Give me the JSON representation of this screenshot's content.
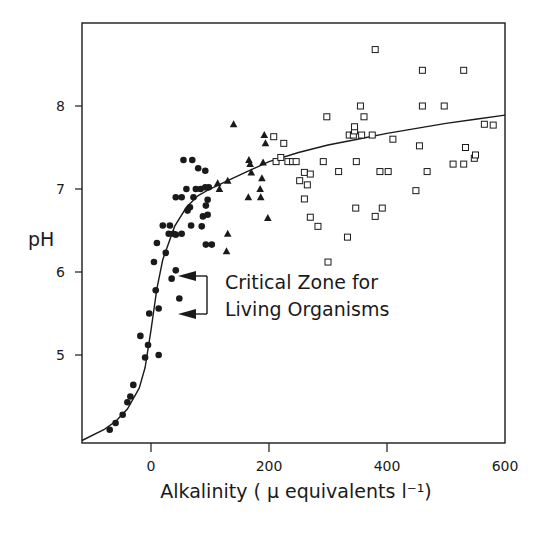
{
  "chart_data": {
    "type": "scatter",
    "title": "",
    "xlabel": "Alkalinity ( μ equivalents l⁻¹)",
    "ylabel": "pH",
    "xlim": [
      -117,
      600
    ],
    "ylim": [
      3.94,
      9.0
    ],
    "xticks": [
      0,
      200,
      400,
      600
    ],
    "yticks": [
      5,
      6,
      7,
      8
    ],
    "grid": false,
    "legend": null,
    "annotations": [
      {
        "text": "Critical Zone for",
        "line": 1
      },
      {
        "text": "Living Organisms",
        "line": 2,
        "arrows_at_pH": [
          5.95,
          5.5
        ]
      }
    ],
    "fit_curve": {
      "name": "titration curve",
      "x": [
        -117,
        -80,
        -60,
        -40,
        -20,
        -10,
        0,
        10,
        20,
        40,
        60,
        80,
        100,
        130,
        160,
        200,
        250,
        300,
        350,
        400,
        450,
        500,
        550,
        600
      ],
      "y": [
        3.97,
        4.1,
        4.2,
        4.35,
        4.6,
        4.85,
        5.3,
        5.8,
        6.15,
        6.55,
        6.78,
        6.92,
        7.0,
        7.1,
        7.2,
        7.33,
        7.44,
        7.53,
        7.6,
        7.67,
        7.73,
        7.79,
        7.84,
        7.89
      ]
    },
    "series": [
      {
        "name": "filled circles",
        "marker": "circle-filled",
        "points": [
          [
            -70,
            4.1
          ],
          [
            -60,
            4.18
          ],
          [
            -48,
            4.28
          ],
          [
            -40,
            4.43
          ],
          [
            -35,
            4.5
          ],
          [
            -30,
            4.64
          ],
          [
            -18,
            5.23
          ],
          [
            -10,
            4.97
          ],
          [
            -5,
            5.12
          ],
          [
            -3,
            5.5
          ],
          [
            5,
            6.12
          ],
          [
            8,
            5.78
          ],
          [
            10,
            6.35
          ],
          [
            13,
            5.56
          ],
          [
            13,
            5.0
          ],
          [
            20,
            6.56
          ],
          [
            25,
            6.23
          ],
          [
            30,
            6.46
          ],
          [
            32,
            6.56
          ],
          [
            35,
            5.92
          ],
          [
            38,
            6.46
          ],
          [
            42,
            6.9
          ],
          [
            42,
            6.45
          ],
          [
            42,
            6.02
          ],
          [
            48,
            5.68
          ],
          [
            52,
            6.9
          ],
          [
            52,
            6.46
          ],
          [
            55,
            7.35
          ],
          [
            60,
            7.0
          ],
          [
            62,
            6.74
          ],
          [
            66,
            6.78
          ],
          [
            68,
            6.56
          ],
          [
            70,
            7.35
          ],
          [
            72,
            6.9
          ],
          [
            76,
            7.0
          ],
          [
            80,
            7.25
          ],
          [
            84,
            7.0
          ],
          [
            86,
            6.55
          ],
          [
            88,
            6.67
          ],
          [
            92,
            7.22
          ],
          [
            92,
            7.02
          ],
          [
            93,
            6.8
          ],
          [
            93,
            6.33
          ],
          [
            96,
            6.69
          ],
          [
            96,
            6.87
          ],
          [
            98,
            7.02
          ],
          [
            103,
            6.33
          ]
        ]
      },
      {
        "name": "filled triangles",
        "marker": "triangle-filled",
        "points": [
          [
            113,
            7.07
          ],
          [
            116,
            7.0
          ],
          [
            128,
            6.25
          ],
          [
            130,
            6.46
          ],
          [
            130,
            7.1
          ],
          [
            140,
            7.78
          ],
          [
            165,
            6.9
          ],
          [
            166,
            7.35
          ],
          [
            168,
            7.3
          ],
          [
            170,
            7.2
          ],
          [
            185,
            7.0
          ],
          [
            186,
            6.9
          ],
          [
            188,
            7.13
          ],
          [
            190,
            7.32
          ],
          [
            192,
            7.65
          ],
          [
            194,
            7.55
          ],
          [
            198,
            6.65
          ]
        ]
      },
      {
        "name": "open squares",
        "marker": "square-open",
        "points": [
          [
            208,
            7.63
          ],
          [
            212,
            7.33
          ],
          [
            220,
            7.38
          ],
          [
            225,
            7.55
          ],
          [
            232,
            7.33
          ],
          [
            240,
            7.33
          ],
          [
            246,
            7.33
          ],
          [
            252,
            7.1
          ],
          [
            260,
            7.2
          ],
          [
            260,
            6.88
          ],
          [
            265,
            7.05
          ],
          [
            270,
            7.18
          ],
          [
            270,
            6.66
          ],
          [
            283,
            6.55
          ],
          [
            292,
            7.33
          ],
          [
            298,
            7.87
          ],
          [
            300,
            6.12
          ],
          [
            318,
            7.21
          ],
          [
            333,
            6.42
          ],
          [
            336,
            7.65
          ],
          [
            343,
            7.65
          ],
          [
            345,
            7.7
          ],
          [
            345,
            7.75
          ],
          [
            347,
            6.77
          ],
          [
            348,
            7.33
          ],
          [
            355,
            8.0
          ],
          [
            357,
            7.65
          ],
          [
            361,
            7.87
          ],
          [
            375,
            7.65
          ],
          [
            380,
            8.68
          ],
          [
            380,
            6.67
          ],
          [
            388,
            7.21
          ],
          [
            392,
            6.77
          ],
          [
            402,
            7.21
          ],
          [
            410,
            7.6
          ],
          [
            449,
            6.98
          ],
          [
            455,
            7.52
          ],
          [
            460,
            8.0
          ],
          [
            460,
            8.43
          ],
          [
            468,
            7.21
          ],
          [
            497,
            8.0
          ],
          [
            512,
            7.3
          ],
          [
            530,
            8.43
          ],
          [
            530,
            7.3
          ],
          [
            533,
            7.5
          ],
          [
            548,
            7.37
          ],
          [
            550,
            7.41
          ],
          [
            565,
            7.78
          ],
          [
            580,
            7.77
          ]
        ]
      }
    ]
  },
  "axes": {
    "x_tick_labels": [
      "0",
      "200",
      "400",
      "600"
    ],
    "y_tick_labels": [
      "8",
      "7",
      "6",
      "5"
    ],
    "x_title": "Alkalinity ( μ equivalents l⁻¹)",
    "y_title": "pH"
  },
  "annotation": {
    "line1": "Critical Zone for",
    "line2": "Living Organisms"
  }
}
